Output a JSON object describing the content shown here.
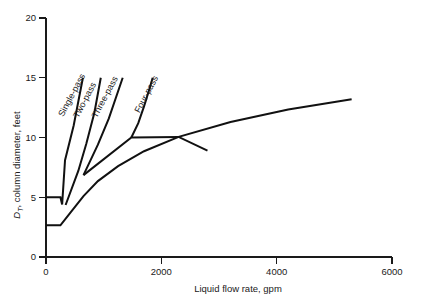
{
  "chart_data": {
    "type": "line",
    "title": "",
    "xlabel": "Liquid flow rate, gpm",
    "ylabel": "D_T, column diameter, feet",
    "ylabel_main": "D",
    "ylabel_sub": "T",
    "ylabel_rest": ", column diameter, feet",
    "xlim": [
      0,
      6000
    ],
    "ylim": [
      0,
      20
    ],
    "grid": false,
    "legend": "inline-curve-labels",
    "xticks": [
      0,
      2000,
      4000,
      6000
    ],
    "xtick_labels": [
      "0",
      "2000",
      "4000",
      "6000"
    ],
    "yticks": [
      0,
      5,
      10,
      15,
      20
    ],
    "ytick_labels": [
      "0",
      "5",
      "10",
      "15",
      "20"
    ],
    "series": [
      {
        "name": "Single-pass",
        "label": "Single-pass",
        "points": [
          [
            0,
            5.0
          ],
          [
            250,
            5.0
          ],
          [
            280,
            4.4
          ],
          [
            330,
            8.1
          ],
          [
            480,
            11.0
          ],
          [
            640,
            15.0
          ]
        ]
      },
      {
        "name": "Two-pass",
        "label": "Two-pass",
        "points": [
          [
            340,
            4.35
          ],
          [
            560,
            7.2
          ],
          [
            700,
            9.5
          ],
          [
            840,
            12.1
          ],
          [
            950,
            15.0
          ]
        ]
      },
      {
        "name": "Three-pass",
        "label": "Three-pass",
        "points": [
          [
            650,
            6.85
          ],
          [
            900,
            9.4
          ],
          [
            1090,
            11.6
          ],
          [
            1330,
            15.0
          ]
        ]
      },
      {
        "name": "Four-pass",
        "label": "Four-pass",
        "points": [
          [
            1480,
            10.0
          ],
          [
            1600,
            11.2
          ],
          [
            1700,
            12.6
          ],
          [
            1790,
            14.0
          ],
          [
            1850,
            15.0
          ]
        ]
      },
      {
        "name": "lower-envelope",
        "label": "",
        "points": [
          [
            0,
            2.65
          ],
          [
            250,
            2.65
          ],
          [
            420,
            3.7
          ],
          [
            650,
            5.1
          ],
          [
            900,
            6.35
          ],
          [
            1250,
            7.6
          ],
          [
            1700,
            8.85
          ],
          [
            2300,
            10.05
          ],
          [
            3200,
            11.3
          ],
          [
            4200,
            12.35
          ],
          [
            5300,
            13.2
          ]
        ]
      },
      {
        "name": "upper-envelope",
        "label": "",
        "points": [
          [
            650,
            6.85
          ],
          [
            1480,
            10.0
          ],
          [
            2300,
            10.05
          ],
          [
            2800,
            8.9
          ]
        ]
      }
    ],
    "curve_labels": [
      {
        "text": "Single-pass",
        "x": 300,
        "y": 11.7,
        "rotation": -62
      },
      {
        "text": "Two-pass",
        "x": 560,
        "y": 11.6,
        "rotation": -62
      },
      {
        "text": "Three-pass",
        "x": 880,
        "y": 11.6,
        "rotation": -62
      },
      {
        "text": "Four-pass",
        "x": 1620,
        "y": 12.0,
        "rotation": -62
      }
    ]
  }
}
